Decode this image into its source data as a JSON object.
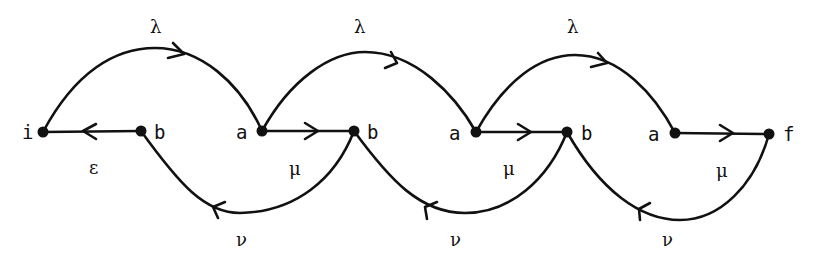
{
  "diagram": {
    "type": "automaton",
    "nodes": [
      {
        "id": "n0",
        "label": "i",
        "x": 43,
        "y": 132
      },
      {
        "id": "n1",
        "label": "b",
        "x": 141,
        "y": 131
      },
      {
        "id": "n2",
        "label": "a",
        "x": 262,
        "y": 131
      },
      {
        "id": "n3",
        "label": "b",
        "x": 354,
        "y": 131
      },
      {
        "id": "n4",
        "label": "a",
        "x": 476,
        "y": 132
      },
      {
        "id": "n5",
        "label": "b",
        "x": 567,
        "y": 132
      },
      {
        "id": "n6",
        "label": "a",
        "x": 675,
        "y": 133
      },
      {
        "id": "n7",
        "label": "f",
        "x": 769,
        "y": 134
      }
    ],
    "edges": [
      {
        "from": "n0",
        "to": "n2",
        "label": "λ",
        "kind": "upper-arc"
      },
      {
        "from": "n2",
        "to": "n4",
        "label": "λ",
        "kind": "upper-arc"
      },
      {
        "from": "n4",
        "to": "n6",
        "label": "λ",
        "kind": "upper-arc"
      },
      {
        "from": "n1",
        "to": "n0",
        "label": "ε",
        "kind": "straight"
      },
      {
        "from": "n2",
        "to": "n3",
        "label": "μ",
        "kind": "straight"
      },
      {
        "from": "n4",
        "to": "n5",
        "label": "μ",
        "kind": "straight"
      },
      {
        "from": "n6",
        "to": "n7",
        "label": "μ",
        "kind": "straight"
      },
      {
        "from": "n3",
        "to": "n1",
        "label": "ν",
        "kind": "lower-arc"
      },
      {
        "from": "n5",
        "to": "n3",
        "label": "ν",
        "kind": "lower-arc"
      },
      {
        "from": "n7",
        "to": "n5",
        "label": "ν",
        "kind": "lower-arc"
      }
    ],
    "labels": {
      "nodes": [
        "i",
        "b",
        "a",
        "b",
        "a",
        "b",
        "a",
        "f"
      ],
      "lambda": [
        "λ",
        "λ",
        "λ"
      ],
      "epsilon": "ε",
      "mu": [
        "μ",
        "μ",
        "μ"
      ],
      "nu": [
        "ν",
        "ν",
        "ν"
      ]
    },
    "colors": {
      "stroke": "#111111",
      "background": "#ffffff"
    }
  }
}
